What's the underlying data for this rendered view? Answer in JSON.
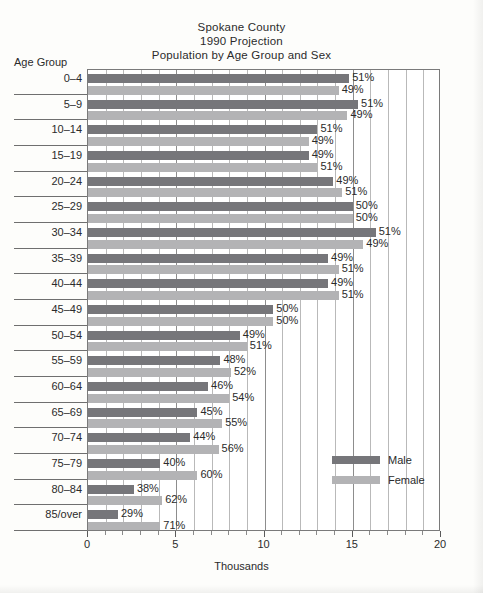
{
  "chart_data": {
    "type": "bar",
    "title": "Spokane County",
    "subtitle": "1990 Projection",
    "subtitle2": "Population by Age Group and Sex",
    "title_lines": [
      "Spokane County",
      "1990 Projection",
      "Population by Age Group and Sex"
    ],
    "xlabel": "Thousands",
    "ylabel": "Age Group",
    "xlim": [
      0,
      20
    ],
    "xticks": [
      0,
      5,
      10,
      15,
      20
    ],
    "xtick_labels": [
      "0",
      "5",
      "10",
      "15",
      "20"
    ],
    "minor_tick_step": 1,
    "grid": true,
    "legend_position": "inside-right-lower",
    "orientation": "horizontal",
    "categories": [
      "0–4",
      "5–9",
      "10–14",
      "15–19",
      "20–24",
      "25–29",
      "30–34",
      "35–39",
      "40–44",
      "45–49",
      "50–54",
      "55–59",
      "60–64",
      "65–69",
      "70–74",
      "75–79",
      "80–84",
      "85/over"
    ],
    "series": [
      {
        "name": "Male",
        "color": "#76767a",
        "values": [
          14.8,
          15.3,
          13.0,
          12.5,
          13.9,
          15.0,
          16.3,
          13.6,
          13.6,
          10.5,
          8.6,
          7.5,
          6.8,
          6.2,
          5.8,
          4.1,
          2.6,
          1.7
        ],
        "labels": [
          "51%",
          "51%",
          "51%",
          "49%",
          "49%",
          "50%",
          "51%",
          "49%",
          "49%",
          "50%",
          "49%",
          "48%",
          "46%",
          "45%",
          "44%",
          "40%",
          "38%",
          "29%"
        ]
      },
      {
        "name": "Female",
        "color": "#b3b3b5",
        "values": [
          14.2,
          14.7,
          12.5,
          13.0,
          14.4,
          15.0,
          15.6,
          14.2,
          14.2,
          10.5,
          9.0,
          8.1,
          8.0,
          7.6,
          7.4,
          6.2,
          4.2,
          4.1
        ],
        "labels": [
          "49%",
          "49%",
          "49%",
          "51%",
          "51%",
          "50%",
          "49%",
          "51%",
          "51%",
          "50%",
          "51%",
          "52%",
          "54%",
          "55%",
          "56%",
          "60%",
          "62%",
          "71%"
        ]
      }
    ]
  },
  "legend": {
    "items": [
      {
        "label": "Male",
        "color": "#76767a"
      },
      {
        "label": "Female",
        "color": "#b3b3b5"
      }
    ]
  }
}
